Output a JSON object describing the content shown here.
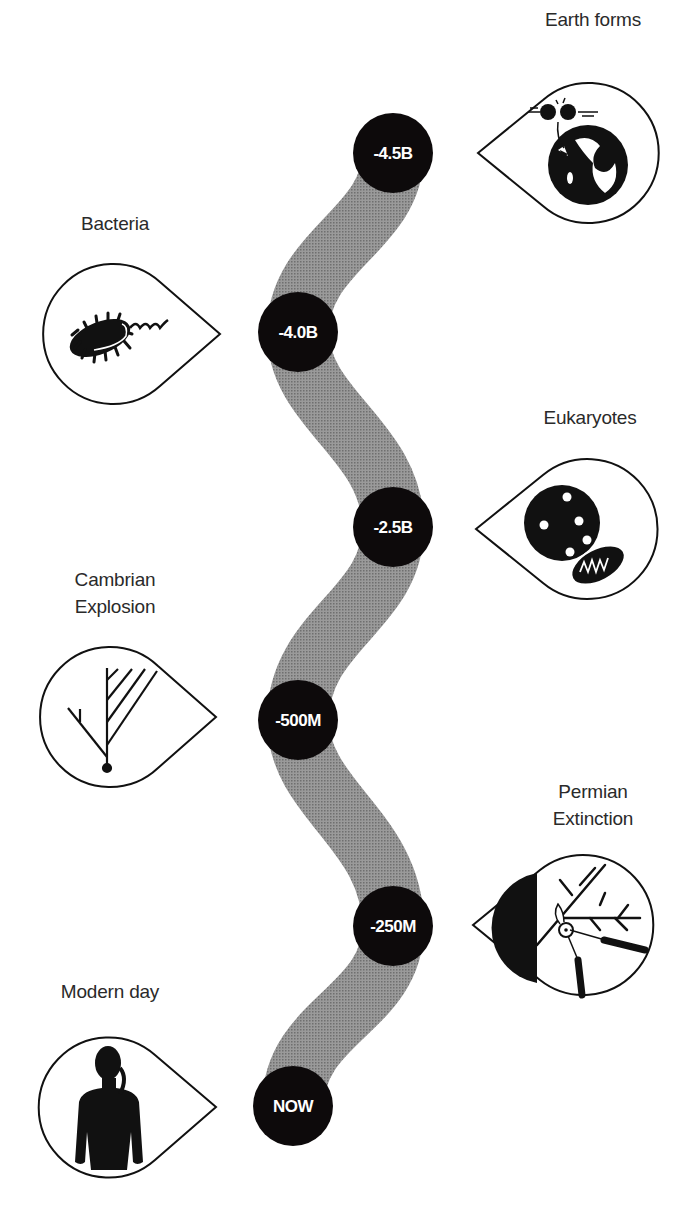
{
  "diagram": {
    "type": "timeline",
    "colors": {
      "path": "#8a8a8a",
      "node": "#0d0a0b",
      "node_text": "#ffffff",
      "outline": "#111111",
      "label": "#2a2a2a"
    },
    "nodes": [
      {
        "label": "-4.5B"
      },
      {
        "label": "-4.0B"
      },
      {
        "label": "-2.5B"
      },
      {
        "label": "-500M"
      },
      {
        "label": "-250M"
      },
      {
        "label": "NOW"
      }
    ],
    "events": [
      {
        "title": "Earth forms",
        "icon": "earth-impact-icon",
        "side": "right"
      },
      {
        "title": "Bacteria",
        "icon": "bacterium-icon",
        "side": "left"
      },
      {
        "title": "Eukaryotes",
        "icon": "eukaryote-cell-icon",
        "side": "right"
      },
      {
        "title_line1": "Cambrian",
        "title_line2": "Explosion",
        "icon": "branching-tree-icon",
        "side": "left"
      },
      {
        "title_line1": "Permian",
        "title_line2": "Extinction",
        "icon": "pruning-shears-icon",
        "side": "right"
      },
      {
        "title": "Modern day",
        "icon": "human-silhouette-icon",
        "side": "left"
      }
    ]
  }
}
